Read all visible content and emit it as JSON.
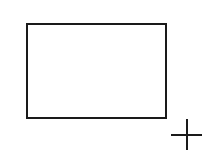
{
  "canvas": {
    "background": "#ffffff",
    "shapes": [
      {
        "type": "rectangle",
        "stroke": "#1a1a1a",
        "fill": "#ffffff"
      }
    ],
    "cursor": {
      "type": "crosshair",
      "icon": "crosshair-icon",
      "color": "#1a1a1a"
    }
  }
}
